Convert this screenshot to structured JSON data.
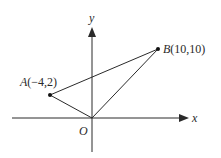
{
  "diagram": {
    "axes": {
      "x_label": "x",
      "y_label": "y",
      "origin_label": "O"
    },
    "points": [
      {
        "name": "A",
        "coords_text": "(−4,2)",
        "x": -4,
        "y": 2
      },
      {
        "name": "B",
        "coords_text": "(10,10)",
        "x": 10,
        "y": 10
      }
    ],
    "segments": [
      [
        "O",
        "A"
      ],
      [
        "A",
        "B"
      ],
      [
        "O",
        "B"
      ]
    ],
    "colors": {
      "line": "#2a2a2a",
      "background": "#ffffff"
    }
  }
}
